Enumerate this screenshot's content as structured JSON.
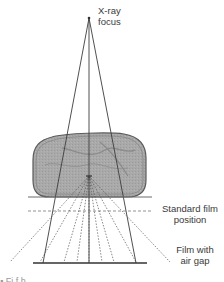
{
  "diagram": {
    "labels": {
      "focus": "X-ray\nfocus",
      "standard_film": "Standard film\nposition",
      "film_air_gap": "Film with\nair gap"
    },
    "clipped_caption": "  ▪  Fi        f    h            "
  },
  "geometry": {
    "focus": {
      "x": 89,
      "y": 18
    },
    "scatter_origin": {
      "x": 89,
      "y": 176
    },
    "body": {
      "x1": 33,
      "y1": 133,
      "x2": 146,
      "y2": 197
    },
    "standard_film_line_y": 197,
    "dashed_line_y": 211,
    "air_gap_film_y": 263
  },
  "colors": {
    "body_fill": "#a8a8a8",
    "body_stroke": "#5a5a5a",
    "line": "#3c3c3c",
    "dashed": "#777777",
    "text": "#3a3a3a"
  }
}
